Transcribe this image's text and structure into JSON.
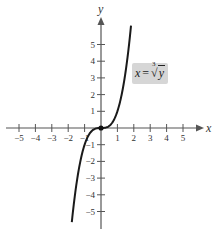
{
  "chart_data": {
    "type": "line",
    "title": "",
    "xlabel": "x",
    "ylabel": "y",
    "xlim": [
      -5.5,
      6.2
    ],
    "ylim": [
      -6.0,
      6.5
    ],
    "grid": false,
    "legend": null,
    "x_ticks": [
      -5,
      -4,
      -3,
      -2,
      -1,
      1,
      2,
      3,
      4,
      5
    ],
    "y_ticks": [
      -5,
      -4,
      -3,
      -2,
      -1,
      1,
      2,
      3,
      4,
      5
    ],
    "x_tick_labels": [
      "−5",
      "−4",
      "−3",
      "−2",
      "−1",
      "1",
      "2",
      "3",
      "4",
      "5"
    ],
    "y_tick_labels": [
      "−5",
      "−4",
      "−3",
      "−2",
      "−1",
      "1",
      "2",
      "3",
      "4",
      "5"
    ],
    "series": [
      {
        "name": "x = ∛y",
        "equation": "y = x^3",
        "x": [
          -1.8,
          -1.6,
          -1.4,
          -1.2,
          -1.0,
          -0.8,
          -0.6,
          -0.4,
          -0.2,
          0,
          0.2,
          0.4,
          0.6,
          0.8,
          1.0,
          1.2,
          1.4,
          1.6,
          1.8
        ],
        "y": [
          -5.83,
          -4.1,
          -2.74,
          -1.73,
          -1.0,
          -0.51,
          -0.22,
          -0.06,
          -0.01,
          0,
          0.01,
          0.06,
          0.22,
          0.51,
          1.0,
          1.73,
          2.74,
          4.1,
          5.83
        ]
      }
    ],
    "annotations": [
      {
        "text": "x = ∛y",
        "position": "upper right of curve",
        "boxed": true
      },
      {
        "type": "point",
        "x": 0,
        "y": 0,
        "filled": true
      }
    ]
  },
  "labels": {
    "x_axis": "x",
    "y_axis": "y",
    "equation_lhs": "x",
    "equation_eq": "=",
    "equation_index": "3",
    "equation_radical": "√",
    "equation_arg": "y"
  },
  "colors": {
    "axis": "#555555",
    "curve": "#1a1a1a",
    "label_box": "#d6d6d6"
  }
}
